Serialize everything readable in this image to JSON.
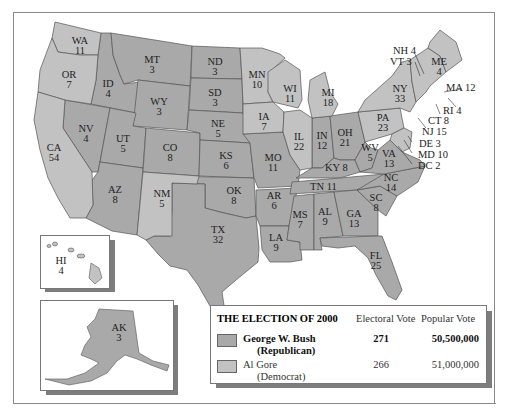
{
  "colors": {
    "republican": "#a9a9a9",
    "democrat": "#c2c2c2",
    "border": "#555555",
    "shadow": "#7d7d7d"
  },
  "legend": {
    "title": "THE ELECTION OF 2000",
    "col_electoral": "Electoral Vote",
    "col_popular": "Popular Vote",
    "candidates": [
      {
        "name": "George W. Bush",
        "party": "(Republican)",
        "electoral": "271",
        "popular": "50,500,000",
        "color": "republican"
      },
      {
        "name": "Al Gore",
        "party": "(Democrat)",
        "electoral": "266",
        "popular": "51,000,000",
        "color": "democrat"
      }
    ]
  },
  "states": [
    {
      "abbr": "WA",
      "ev": "11",
      "winner": "D"
    },
    {
      "abbr": "OR",
      "ev": "7",
      "winner": "D"
    },
    {
      "abbr": "CA",
      "ev": "54",
      "winner": "D"
    },
    {
      "abbr": "ID",
      "ev": "4",
      "winner": "R"
    },
    {
      "abbr": "NV",
      "ev": "4",
      "winner": "R"
    },
    {
      "abbr": "MT",
      "ev": "3",
      "winner": "R"
    },
    {
      "abbr": "WY",
      "ev": "3",
      "winner": "R"
    },
    {
      "abbr": "UT",
      "ev": "5",
      "winner": "R"
    },
    {
      "abbr": "AZ",
      "ev": "8",
      "winner": "R"
    },
    {
      "abbr": "CO",
      "ev": "8",
      "winner": "R"
    },
    {
      "abbr": "NM",
      "ev": "5",
      "winner": "D"
    },
    {
      "abbr": "ND",
      "ev": "3",
      "winner": "R"
    },
    {
      "abbr": "SD",
      "ev": "3",
      "winner": "R"
    },
    {
      "abbr": "NE",
      "ev": "5",
      "winner": "R"
    },
    {
      "abbr": "KS",
      "ev": "6",
      "winner": "R"
    },
    {
      "abbr": "OK",
      "ev": "8",
      "winner": "R"
    },
    {
      "abbr": "TX",
      "ev": "32",
      "winner": "R"
    },
    {
      "abbr": "MN",
      "ev": "10",
      "winner": "D"
    },
    {
      "abbr": "IA",
      "ev": "7",
      "winner": "D"
    },
    {
      "abbr": "MO",
      "ev": "11",
      "winner": "R"
    },
    {
      "abbr": "AR",
      "ev": "6",
      "winner": "R"
    },
    {
      "abbr": "LA",
      "ev": "9",
      "winner": "R"
    },
    {
      "abbr": "WI",
      "ev": "11",
      "winner": "D"
    },
    {
      "abbr": "IL",
      "ev": "22",
      "winner": "D"
    },
    {
      "abbr": "MI",
      "ev": "18",
      "winner": "D"
    },
    {
      "abbr": "IN",
      "ev": "12",
      "winner": "R"
    },
    {
      "abbr": "OH",
      "ev": "21",
      "winner": "R"
    },
    {
      "abbr": "KY",
      "ev": "8",
      "winner": "R"
    },
    {
      "abbr": "TN",
      "ev": "11",
      "winner": "R"
    },
    {
      "abbr": "MS",
      "ev": "7",
      "winner": "R"
    },
    {
      "abbr": "AL",
      "ev": "9",
      "winner": "R"
    },
    {
      "abbr": "GA",
      "ev": "13",
      "winner": "R"
    },
    {
      "abbr": "FL",
      "ev": "25",
      "winner": "R"
    },
    {
      "abbr": "SC",
      "ev": "8",
      "winner": "R"
    },
    {
      "abbr": "NC",
      "ev": "14",
      "winner": "R"
    },
    {
      "abbr": "VA",
      "ev": "13",
      "winner": "R"
    },
    {
      "abbr": "WV",
      "ev": "5",
      "winner": "R"
    },
    {
      "abbr": "PA",
      "ev": "23",
      "winner": "D"
    },
    {
      "abbr": "NY",
      "ev": "33",
      "winner": "D"
    },
    {
      "abbr": "ME",
      "ev": "4",
      "winner": "D"
    },
    {
      "abbr": "HI",
      "ev": "4",
      "winner": "D"
    },
    {
      "abbr": "AK",
      "ev": "3",
      "winner": "R"
    }
  ],
  "callouts": [
    {
      "text": "NH 4"
    },
    {
      "text": "VT 3"
    },
    {
      "text": "MA 12"
    },
    {
      "text": "RI 4"
    },
    {
      "text": "CT 8"
    },
    {
      "text": "NJ 15"
    },
    {
      "text": "DE 3"
    },
    {
      "text": "MD 10"
    },
    {
      "text": "DC 2"
    },
    {
      "text": "KY 8"
    },
    {
      "text": "TN 11"
    }
  ]
}
